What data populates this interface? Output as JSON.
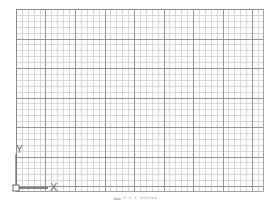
{
  "viewport": {
    "background": "#ffffff",
    "grid": {
      "left": 16,
      "top": 9,
      "right": 263,
      "bottom": 191,
      "minor_spacing": 5.9,
      "major_every": 5,
      "minor_color": "#c8c8c8",
      "major_color": "#8a8a8a",
      "border_color": "#8a8a8a"
    },
    "ucs_icon": {
      "x_label": "X",
      "y_label": "Y",
      "color": "#6a6a6a",
      "origin": [
        16,
        188
      ]
    }
  },
  "caption": {
    "text": "▬ ▪ ▪ ▪  ▪▪▪▪▪▪"
  }
}
